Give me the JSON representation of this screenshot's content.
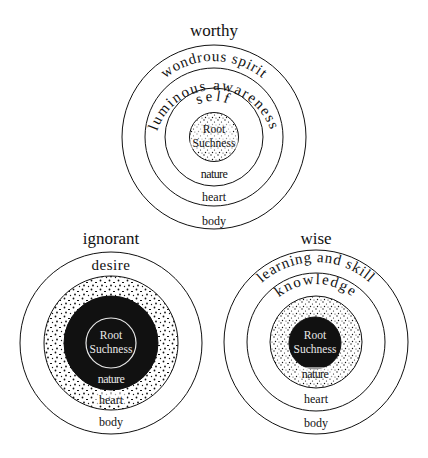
{
  "diagrams": {
    "worthy": {
      "title": "worthy",
      "rings": {
        "outer_arc": "wondrous spirit",
        "second_arc": "luminous awareness",
        "third_arc": "self",
        "core_line1": "Root",
        "core_line2": "Suchness",
        "nature": "nature",
        "heart": "heart",
        "body": "body"
      }
    },
    "ignorant": {
      "title": "ignorant",
      "rings": {
        "outer_label": "desire",
        "core_line1": "Root",
        "core_line2": "Suchness",
        "nature": "nature",
        "heart": "heart",
        "body": "body"
      }
    },
    "wise": {
      "title": "wise",
      "rings": {
        "outer_arc": "learning and skill",
        "second_arc": "knowledge",
        "core_line1": "Root",
        "core_line2": "Suchness",
        "nature": "nature",
        "heart": "heart",
        "body": "body"
      }
    }
  },
  "colors": {
    "ink": "#111111",
    "background": "#ffffff"
  }
}
